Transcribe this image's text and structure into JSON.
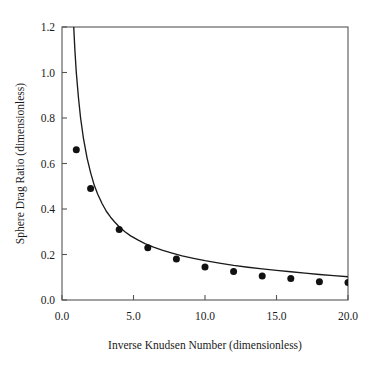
{
  "chart_data": {
    "type": "scatter",
    "title": "",
    "xlabel": "Inverse Knudsen Number (dimensionless)",
    "ylabel": "Sphere Drag Ratio (dimensionless)",
    "xlim": [
      0.0,
      20.0
    ],
    "ylim": [
      0.0,
      1.2
    ],
    "xticks": [
      0.0,
      5.0,
      10.0,
      15.0,
      20.0
    ],
    "yticks": [
      0.0,
      0.2,
      0.4,
      0.6,
      0.8,
      1.0,
      1.2
    ],
    "xtick_labels": [
      "0.0",
      "5.0",
      "10.0",
      "15.0",
      "20.0"
    ],
    "ytick_labels": [
      "0.0",
      "0.2",
      "0.4",
      "0.6",
      "0.8",
      "1.0",
      "1.2"
    ],
    "grid": false,
    "legend": null,
    "series": [
      {
        "name": "measured-points",
        "type": "scatter",
        "marker": "filled-circle",
        "color": "#111111",
        "x": [
          1.0,
          2.0,
          4.0,
          6.0,
          8.0,
          10.0,
          12.0,
          14.0,
          16.0,
          18.0,
          20.0
        ],
        "values": [
          0.66,
          0.49,
          0.31,
          0.23,
          0.18,
          0.145,
          0.125,
          0.105,
          0.095,
          0.08,
          0.077
        ]
      },
      {
        "name": "model-curve",
        "type": "line",
        "color": "#1a1a1a",
        "x": [
          0.82,
          0.9,
          1.0,
          1.15,
          1.3,
          1.5,
          1.75,
          2.0,
          2.25,
          2.5,
          2.8,
          3.1,
          3.4,
          3.7,
          4.0,
          4.4,
          4.8,
          5.3,
          5.8,
          6.4,
          7.0,
          7.7,
          8.4,
          9.2,
          10.0,
          11.0,
          12.0,
          13.0,
          14.0,
          15.0,
          16.0,
          17.0,
          18.0,
          19.0,
          20.0
        ],
        "values": [
          1.2,
          1.1,
          1.0,
          0.89,
          0.8,
          0.71,
          0.625,
          0.56,
          0.505,
          0.465,
          0.424,
          0.39,
          0.364,
          0.342,
          0.322,
          0.3,
          0.282,
          0.264,
          0.248,
          0.232,
          0.219,
          0.206,
          0.194,
          0.183,
          0.173,
          0.162,
          0.152,
          0.144,
          0.137,
          0.13,
          0.124,
          0.118,
          0.112,
          0.107,
          0.102
        ]
      }
    ]
  },
  "axes": {
    "x_title": "Inverse Knudsen Number (dimensionless)",
    "y_title": "Sphere Drag Ratio (dimensionless)"
  },
  "colors": {
    "marker": "#111111",
    "curve": "#1a1a1a",
    "frame": "#555555",
    "background": "#ffffff"
  }
}
